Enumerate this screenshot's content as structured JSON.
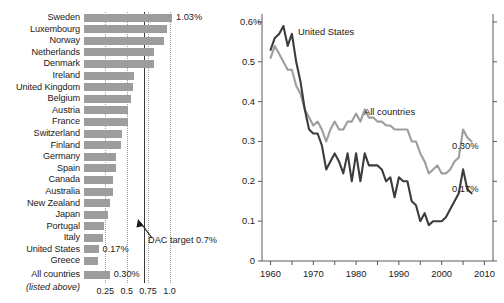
{
  "chart_data": [
    {
      "type": "bar",
      "orientation": "horizontal",
      "title": "Official development assistance as share of gross national income",
      "xlabel": "",
      "ylabel": "",
      "xlim": [
        0,
        1.12
      ],
      "xticks": [
        0.25,
        0.5,
        0.75,
        1.0
      ],
      "xtick_labels": [
        "0.25",
        "0.5",
        "0.75",
        "1.0"
      ],
      "grid": "vertical-dotted",
      "reference_line": {
        "value": 0.7,
        "label": "DAC target 0.7%",
        "style": "solid"
      },
      "bar_color": "#9d9d9d",
      "categories": [
        "Sweden",
        "Luxembourg",
        "Norway",
        "Netherlands",
        "Denmark",
        "Ireland",
        "United Kingdom",
        "Belgium",
        "Austria",
        "France",
        "Switzerland",
        "Finland",
        "Germany",
        "Spain",
        "Canada",
        "Australia",
        "New Zealand",
        "Japan",
        "Portugal",
        "Italy",
        "United States",
        "Greece",
        "All countries"
      ],
      "values": [
        1.03,
        0.97,
        0.94,
        0.82,
        0.82,
        0.59,
        0.57,
        0.55,
        0.52,
        0.51,
        0.44,
        0.43,
        0.38,
        0.37,
        0.34,
        0.34,
        0.3,
        0.28,
        0.23,
        0.22,
        0.17,
        0.16,
        0.3
      ],
      "value_labels": {
        "Sweden": "1.03%",
        "United States": "0.17%",
        "All countries": "0.30%"
      },
      "footnote": "(listed above)"
    },
    {
      "type": "line",
      "title": "",
      "xlabel": "",
      "ylabel": "",
      "xlim": [
        1958,
        2012
      ],
      "ylim": [
        0,
        0.62
      ],
      "xticks": [
        1960,
        1970,
        1980,
        1990,
        2000,
        2010
      ],
      "xtick_labels": [
        "1960",
        "1970",
        "1980",
        "1990",
        "2000",
        "2010"
      ],
      "yticks": [
        0,
        0.1,
        0.2,
        0.3,
        0.4,
        0.5,
        0.6
      ],
      "ytick_labels": [
        "0",
        "0.1",
        "0.2",
        "0.3",
        "0.4",
        "0.5",
        "0.6%"
      ],
      "grid": false,
      "legend_position": "inline-annotations",
      "series": [
        {
          "name": "United States",
          "color": "#3c3c3c",
          "end_label": "0.17%",
          "x": [
            1960,
            1961,
            1962,
            1963,
            1964,
            1965,
            1966,
            1967,
            1968,
            1969,
            1970,
            1971,
            1972,
            1973,
            1974,
            1975,
            1976,
            1977,
            1978,
            1979,
            1980,
            1981,
            1982,
            1983,
            1984,
            1985,
            1986,
            1987,
            1988,
            1989,
            1990,
            1991,
            1992,
            1993,
            1994,
            1995,
            1996,
            1997,
            1998,
            1999,
            2000,
            2001,
            2002,
            2003,
            2004,
            2005,
            2006,
            2007
          ],
          "y": [
            0.53,
            0.56,
            0.57,
            0.59,
            0.54,
            0.57,
            0.5,
            0.45,
            0.38,
            0.33,
            0.32,
            0.32,
            0.29,
            0.23,
            0.25,
            0.27,
            0.25,
            0.22,
            0.27,
            0.2,
            0.27,
            0.2,
            0.27,
            0.24,
            0.24,
            0.24,
            0.23,
            0.2,
            0.21,
            0.16,
            0.21,
            0.2,
            0.2,
            0.15,
            0.14,
            0.1,
            0.12,
            0.09,
            0.1,
            0.1,
            0.1,
            0.11,
            0.13,
            0.15,
            0.17,
            0.23,
            0.18,
            0.17
          ]
        },
        {
          "name": "All countries",
          "color": "#9d9d9d",
          "end_label": "0.30%",
          "x": [
            1960,
            1961,
            1962,
            1963,
            1964,
            1965,
            1966,
            1967,
            1968,
            1969,
            1970,
            1971,
            1972,
            1973,
            1974,
            1975,
            1976,
            1977,
            1978,
            1979,
            1980,
            1981,
            1982,
            1983,
            1984,
            1985,
            1986,
            1987,
            1988,
            1989,
            1990,
            1991,
            1992,
            1993,
            1994,
            1995,
            1996,
            1997,
            1998,
            1999,
            2000,
            2001,
            2002,
            2003,
            2004,
            2005,
            2006,
            2007
          ],
          "y": [
            0.51,
            0.54,
            0.52,
            0.5,
            0.48,
            0.48,
            0.44,
            0.42,
            0.38,
            0.36,
            0.34,
            0.35,
            0.33,
            0.3,
            0.33,
            0.35,
            0.33,
            0.33,
            0.35,
            0.35,
            0.37,
            0.35,
            0.38,
            0.36,
            0.36,
            0.35,
            0.35,
            0.34,
            0.34,
            0.33,
            0.33,
            0.33,
            0.33,
            0.3,
            0.3,
            0.27,
            0.25,
            0.22,
            0.23,
            0.24,
            0.22,
            0.22,
            0.23,
            0.25,
            0.26,
            0.33,
            0.31,
            0.3
          ]
        }
      ]
    }
  ]
}
